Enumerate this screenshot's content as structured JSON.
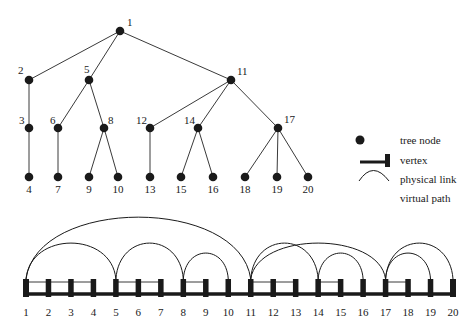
{
  "tree": {
    "nodes": [
      {
        "id": "1"
      },
      {
        "id": "2"
      },
      {
        "id": "5"
      },
      {
        "id": "11"
      },
      {
        "id": "3"
      },
      {
        "id": "6"
      },
      {
        "id": "8"
      },
      {
        "id": "12"
      },
      {
        "id": "14"
      },
      {
        "id": "17"
      },
      {
        "id": "4"
      },
      {
        "id": "7"
      },
      {
        "id": "9"
      },
      {
        "id": "10"
      },
      {
        "id": "13"
      },
      {
        "id": "15"
      },
      {
        "id": "16"
      },
      {
        "id": "18"
      },
      {
        "id": "19"
      },
      {
        "id": "20"
      }
    ],
    "edges": [
      [
        "1",
        "2"
      ],
      [
        "1",
        "5"
      ],
      [
        "1",
        "11"
      ],
      [
        "2",
        "3"
      ],
      [
        "3",
        "4"
      ],
      [
        "5",
        "6"
      ],
      [
        "5",
        "8"
      ],
      [
        "6",
        "7"
      ],
      [
        "8",
        "9"
      ],
      [
        "8",
        "10"
      ],
      [
        "11",
        "12"
      ],
      [
        "11",
        "14"
      ],
      [
        "11",
        "17"
      ],
      [
        "12",
        "13"
      ],
      [
        "14",
        "15"
      ],
      [
        "14",
        "16"
      ],
      [
        "17",
        "18"
      ],
      [
        "17",
        "19"
      ],
      [
        "17",
        "20"
      ]
    ]
  },
  "legend": {
    "items": [
      {
        "symbol": "tree-node",
        "label": "tree node"
      },
      {
        "symbol": "vertex",
        "label": "vertex"
      },
      {
        "symbol": "physical-link",
        "label": "physical link"
      },
      {
        "symbol": "virtual-path",
        "label": "virtual path"
      }
    ]
  },
  "linear": {
    "vertices": [
      "1",
      "2",
      "3",
      "4",
      "5",
      "6",
      "7",
      "8",
      "9",
      "10",
      "11",
      "12",
      "13",
      "14",
      "15",
      "16",
      "17",
      "18",
      "19",
      "20"
    ],
    "virtual_paths": [
      [
        "1",
        "11"
      ],
      [
        "1",
        "5"
      ],
      [
        "5",
        "8"
      ],
      [
        "8",
        "10"
      ],
      [
        "11",
        "17"
      ],
      [
        "11",
        "14"
      ],
      [
        "14",
        "16"
      ],
      [
        "17",
        "20"
      ],
      [
        "17",
        "19"
      ]
    ],
    "thin_links": [
      [
        "1",
        "4"
      ],
      [
        "5",
        "7"
      ],
      [
        "8",
        "9"
      ],
      [
        "11",
        "13"
      ],
      [
        "14",
        "15"
      ],
      [
        "17",
        "18"
      ]
    ]
  },
  "colors": {
    "ink": "#1a1a1a",
    "line": "#3a3a3a"
  }
}
